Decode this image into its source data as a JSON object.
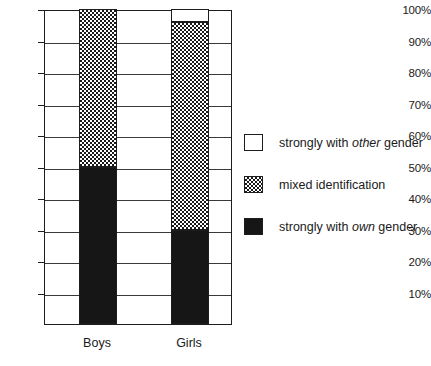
{
  "chart_data": {
    "type": "bar",
    "subtype": "stacked-100-percent",
    "title": "",
    "xlabel": "",
    "ylabel": "",
    "categories": [
      "Boys",
      "Girls"
    ],
    "ylim": [
      0,
      100
    ],
    "ytick_labels": [
      "10%",
      "20%",
      "30%",
      "40%",
      "50%",
      "60%",
      "70%",
      "80%",
      "90%",
      "100%"
    ],
    "ytick_values": [
      10,
      20,
      30,
      40,
      50,
      60,
      70,
      80,
      90,
      100
    ],
    "grid": true,
    "legend_position": "right",
    "series": [
      {
        "name": "strongly with own gender",
        "key": "own",
        "fill": "solid-black",
        "values": [
          50,
          30
        ]
      },
      {
        "name": "mixed identification",
        "key": "mixed",
        "fill": "checkered",
        "values": [
          50,
          66
        ]
      },
      {
        "name": "strongly with other gender",
        "key": "other",
        "fill": "white",
        "values": [
          0,
          4
        ]
      }
    ]
  },
  "axis": {
    "yticks": [
      {
        "label": "100%",
        "value": 100
      },
      {
        "label": "90%",
        "value": 90
      },
      {
        "label": "80%",
        "value": 80
      },
      {
        "label": "70%",
        "value": 70
      },
      {
        "label": "60%",
        "value": 60
      },
      {
        "label": "50%",
        "value": 50
      },
      {
        "label": "40%",
        "value": 40
      },
      {
        "label": "30%",
        "value": 30
      },
      {
        "label": "20%",
        "value": 20
      },
      {
        "label": "10%",
        "value": 10
      }
    ],
    "xticks": [
      {
        "label": "Boys"
      },
      {
        "label": "Girls"
      }
    ]
  },
  "legend": {
    "items": [
      {
        "swatch": "white",
        "prefix": "strongly with ",
        "emphasis": "other",
        "suffix": " gender"
      },
      {
        "swatch": "checkered",
        "prefix": "mixed identification",
        "emphasis": "",
        "suffix": ""
      },
      {
        "swatch": "black",
        "prefix": "strongly with ",
        "emphasis": "own",
        "suffix": " gender"
      }
    ]
  }
}
